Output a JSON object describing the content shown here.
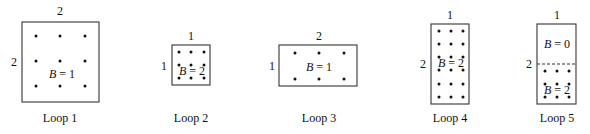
{
  "loops": [
    {
      "caption": "Loop 1",
      "top_dim": "2",
      "left_dim": "2",
      "regions": [
        {
          "b_var": "B",
          "b_eq": " = 1"
        }
      ],
      "box": {
        "x": 22,
        "y": 22,
        "w": 77,
        "h": 80
      },
      "dots": {
        "cols": [
          36,
          60,
          85
        ],
        "rows": [
          36,
          61,
          86
        ]
      }
    },
    {
      "caption": "Loop 2",
      "top_dim": "1",
      "left_dim": "1",
      "regions": [
        {
          "b_var": "B",
          "b_eq": " = 2"
        }
      ],
      "box": {
        "x": 172,
        "y": 45,
        "w": 38,
        "h": 40
      },
      "dots": {
        "cols": [
          179,
          191,
          204
        ],
        "rows": [
          52,
          65,
          78
        ]
      }
    },
    {
      "caption": "Loop 3",
      "top_dim": "2",
      "left_dim": "1",
      "regions": [
        {
          "b_var": "B",
          "b_eq": " = 1"
        }
      ],
      "box": {
        "x": 279,
        "y": 45,
        "w": 78,
        "h": 41
      },
      "dots": {
        "cols": [
          295,
          319,
          344
        ],
        "rows": [
          53,
          79
        ]
      }
    },
    {
      "caption": "Loop 4",
      "top_dim": "1",
      "left_dim": "2",
      "regions": [
        {
          "b_var": "B",
          "b_eq": " = 2"
        }
      ],
      "box": {
        "x": 431,
        "y": 24,
        "w": 38,
        "h": 80
      },
      "dots": {
        "cols": [
          439,
          451,
          463
        ],
        "rows": [
          31,
          44,
          57,
          70,
          84,
          97
        ]
      }
    },
    {
      "caption": "Loop 5",
      "top_dim": "1",
      "left_dim": "2",
      "regions": [
        {
          "b_var": "B",
          "b_eq": " = 0"
        },
        {
          "b_var": "B",
          "b_eq": " = 2"
        }
      ],
      "box": {
        "x": 537,
        "y": 24,
        "w": 39,
        "h": 80
      },
      "divider_y": 64,
      "dots": {
        "cols": [
          545,
          557,
          569
        ],
        "rows": [
          71,
          84,
          97
        ]
      }
    }
  ]
}
